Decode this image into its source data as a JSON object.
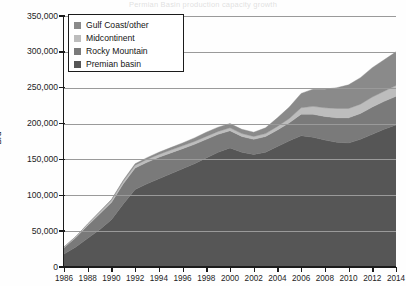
{
  "title_faint": "Permian Basin production capacity growth",
  "axis": {
    "ylabel": "B/d",
    "yticks": [
      "0",
      "50,000",
      "100,000",
      "150,000",
      "200,000",
      "250,000",
      "300,000",
      "350,000"
    ],
    "xticks": [
      "1986",
      "1988",
      "1990",
      "1992",
      "1994",
      "1996",
      "1998",
      "2000",
      "2002",
      "2004",
      "2006",
      "2008",
      "2010",
      "2012",
      "2014"
    ]
  },
  "legend": {
    "items": [
      {
        "label": "Gulf Coast/other",
        "color": "#8a8a8a"
      },
      {
        "label": "Midcontinent",
        "color": "#bdbdbd"
      },
      {
        "label": "Rocky Mountain",
        "color": "#7a7a7a"
      },
      {
        "label": "Premian basin",
        "color": "#565656"
      }
    ]
  },
  "chart_data": {
    "type": "area",
    "stacked": true,
    "title": "",
    "xlabel": "",
    "ylabel": "B/d",
    "ylim": [
      0,
      350000
    ],
    "xlim": [
      1986,
      2014
    ],
    "grid": true,
    "legend_position": "top-left",
    "x": [
      1986,
      1987,
      1988,
      1989,
      1990,
      1991,
      1992,
      1993,
      1994,
      1995,
      1996,
      1997,
      1998,
      1999,
      2000,
      2001,
      2002,
      2003,
      2004,
      2005,
      2006,
      2007,
      2008,
      2009,
      2010,
      2011,
      2012,
      2013,
      2014
    ],
    "series": [
      {
        "name": "Premian basin",
        "color": "#565656",
        "values": [
          18000,
          28000,
          40000,
          52000,
          66000,
          88000,
          108000,
          116000,
          123000,
          130000,
          137000,
          144000,
          152000,
          160000,
          166000,
          160000,
          157000,
          160000,
          168000,
          176000,
          183000,
          181000,
          177000,
          174000,
          173000,
          178000,
          185000,
          192000,
          198000
        ]
      },
      {
        "name": "Rocky Mountain",
        "color": "#7a7a7a",
        "values": [
          9000,
          13000,
          18000,
          22000,
          24000,
          28000,
          30000,
          30000,
          30000,
          29000,
          28000,
          27000,
          26000,
          25000,
          24000,
          22000,
          21000,
          22000,
          23000,
          25000,
          30000,
          32000,
          33000,
          34000,
          35000,
          36000,
          38000,
          39000,
          40000
        ]
      },
      {
        "name": "Midcontinent",
        "color": "#bdbdbd",
        "values": [
          1000,
          1500,
          2000,
          2500,
          3000,
          3500,
          4000,
          4000,
          4000,
          4000,
          4000,
          4000,
          4000,
          4000,
          4000,
          4000,
          4000,
          4000,
          5000,
          6000,
          9000,
          11000,
          12000,
          13000,
          13000,
          13000,
          14000,
          14000,
          15000
        ]
      },
      {
        "name": "Gulf Coast/other",
        "color": "#8a8a8a",
        "values": [
          0,
          0,
          0,
          500,
          1000,
          1500,
          2000,
          2500,
          3000,
          3500,
          4000,
          5000,
          6000,
          6000,
          6000,
          6000,
          6000,
          8000,
          12000,
          16000,
          20000,
          24000,
          26000,
          29000,
          33000,
          37000,
          41000,
          44000,
          47000
        ]
      }
    ]
  }
}
